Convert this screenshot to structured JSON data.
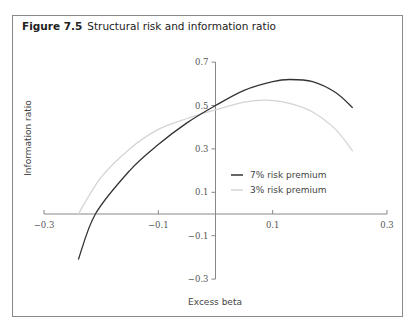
{
  "figure": {
    "number_label": "Figure 7.5",
    "title": "Structural risk and information ratio"
  },
  "chart_data": {
    "type": "line",
    "title": "Structural risk and information ratio",
    "xlabel": "Excess beta",
    "ylabel": "Information ratio",
    "xlim": [
      -0.3,
      0.3
    ],
    "ylim": [
      -0.3,
      0.7
    ],
    "x_ticks": [
      -0.3,
      -0.1,
      0.1,
      0.3
    ],
    "x_tick_labels": [
      "−0.3",
      "−0.1",
      "0.1",
      "0.3"
    ],
    "y_ticks": [
      0.7,
      0.5,
      0.3,
      0.1,
      -0.1,
      -0.3
    ],
    "y_tick_labels": [
      "0.7",
      "0.5",
      "0.3",
      "0.1",
      "−0.1",
      "−0.3"
    ],
    "grid": false,
    "legend_position": "center-right",
    "series": [
      {
        "name": "7% risk premium",
        "color": "#333333",
        "x": [
          -0.24,
          -0.21,
          -0.15,
          -0.1,
          -0.05,
          0.0,
          0.05,
          0.1,
          0.13,
          0.17,
          0.21,
          0.24
        ],
        "y": [
          -0.21,
          0.0,
          0.2,
          0.32,
          0.42,
          0.5,
          0.57,
          0.61,
          0.62,
          0.61,
          0.56,
          0.49
        ]
      },
      {
        "name": "3% risk premium",
        "color": "#d4d4d4",
        "x": [
          -0.24,
          -0.2,
          -0.15,
          -0.1,
          -0.05,
          0.0,
          0.05,
          0.09,
          0.13,
          0.17,
          0.21,
          0.24
        ],
        "y": [
          0.0,
          0.17,
          0.3,
          0.39,
          0.44,
          0.48,
          0.515,
          0.525,
          0.51,
          0.47,
          0.39,
          0.29
        ]
      }
    ]
  }
}
